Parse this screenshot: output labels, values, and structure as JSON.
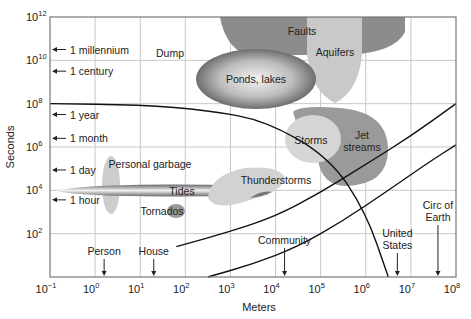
{
  "chart_data": {
    "type": "scatter",
    "title": "",
    "xlabel": "Meters",
    "ylabel": "Seconds",
    "xscale": "log",
    "yscale": "log",
    "xlim": [
      0.1,
      100000000
    ],
    "ylim": [
      1,
      1000000000000
    ],
    "grid": true,
    "x_ticks": [
      {
        "base": "10",
        "exp": "−1",
        "v": -1
      },
      {
        "base": "10",
        "exp": "0",
        "v": 0
      },
      {
        "base": "10",
        "exp": "1",
        "v": 1
      },
      {
        "base": "10",
        "exp": "2",
        "v": 2
      },
      {
        "base": "10",
        "exp": "3",
        "v": 3
      },
      {
        "base": "10",
        "exp": "4",
        "v": 4
      },
      {
        "base": "10",
        "exp": "5",
        "v": 5
      },
      {
        "base": "10",
        "exp": "6",
        "v": 6
      },
      {
        "base": "10",
        "exp": "7",
        "v": 7
      },
      {
        "base": "10",
        "exp": "8",
        "v": 8
      }
    ],
    "y_ticks": [
      {
        "base": "10",
        "exp": "2",
        "v": 2
      },
      {
        "base": "10",
        "exp": "4",
        "v": 4
      },
      {
        "base": "10",
        "exp": "6",
        "v": 6
      },
      {
        "base": "10",
        "exp": "8",
        "v": 8
      },
      {
        "base": "10",
        "exp": "10",
        "v": 10
      },
      {
        "base": "10",
        "exp": "12",
        "v": 12
      }
    ],
    "time_markers": [
      {
        "label": "1 millennium",
        "log_seconds": 10.5
      },
      {
        "label": "1 century",
        "log_seconds": 9.5
      },
      {
        "label": "1 year",
        "log_seconds": 7.5
      },
      {
        "label": "1 month",
        "log_seconds": 6.4
      },
      {
        "label": "1 day",
        "log_seconds": 4.94
      },
      {
        "label": "1 hour",
        "log_seconds": 3.56
      }
    ],
    "length_markers": [
      {
        "label": "Person",
        "log_meters": 0.2
      },
      {
        "label": "House",
        "log_meters": 1.3
      },
      {
        "label": "Community",
        "log_meters": 4.2
      },
      {
        "label": "United\nStates",
        "log_meters": 6.7
      },
      {
        "label": "Circ of\nEarth",
        "log_meters": 7.6
      }
    ],
    "regions": [
      {
        "label": "Faults",
        "log_x_range": [
          2.4,
          5.8
        ],
        "log_y_range": [
          10.2,
          12
        ]
      },
      {
        "label": "Aquifers",
        "log_x_range": [
          4.5,
          5.5
        ],
        "log_y_range": [
          8.1,
          12
        ]
      },
      {
        "label": "Dump",
        "log_x": [
          1.6
        ],
        "log_y": [
          10.4
        ]
      },
      {
        "label": "Ponds, lakes",
        "log_x_range": [
          2.2,
          4.3
        ],
        "log_y_range": [
          8.2,
          10.0
        ]
      },
      {
        "label": "Storms",
        "log_x_range": [
          4.0,
          5.2
        ],
        "log_y_range": [
          5.5,
          7.0
        ]
      },
      {
        "label": "Jet streams",
        "log_x_range": [
          4.0,
          6.0
        ],
        "log_y_range": [
          4.4,
          7.8
        ]
      },
      {
        "label": "Personal garbage",
        "log_x_range": [
          0.1,
          0.6
        ],
        "log_y_range": [
          3.4,
          5.0
        ]
      },
      {
        "label": "Tides",
        "log_x_range": [
          -0.1,
          4.2
        ],
        "log_y_range": [
          3.8,
          4.2
        ]
      },
      {
        "label": "Tornados",
        "log_x_range": [
          1.7,
          2.1
        ],
        "log_y_range": [
          3.2,
          3.7
        ]
      },
      {
        "label": "Thunderstorms",
        "log_x_range": [
          2.4,
          4.0
        ],
        "log_y_range": [
          3.4,
          5.1
        ]
      }
    ],
    "curves": [
      {
        "name": "residence boundary",
        "points": [
          [
            -1,
            8.0
          ],
          [
            1,
            7.95
          ],
          [
            2.5,
            7.7
          ],
          [
            3.8,
            7.2
          ],
          [
            5.2,
            5.5
          ],
          [
            6.0,
            3.0
          ],
          [
            6.5,
            0
          ]
        ]
      },
      {
        "name": "lower diagonal 1",
        "points": [
          [
            1.8,
            1.4
          ],
          [
            3,
            2.1
          ],
          [
            4,
            2.8
          ],
          [
            5,
            3.9
          ],
          [
            6,
            5.2
          ],
          [
            7,
            6.5
          ],
          [
            8,
            8.0
          ]
        ]
      },
      {
        "name": "lower diagonal 2",
        "points": [
          [
            2.5,
            0
          ],
          [
            3.5,
            0.6
          ],
          [
            4.5,
            1.4
          ],
          [
            5.5,
            2.6
          ],
          [
            6.5,
            4.0
          ],
          [
            7.4,
            5.3
          ],
          [
            8,
            6.1
          ]
        ]
      }
    ]
  }
}
